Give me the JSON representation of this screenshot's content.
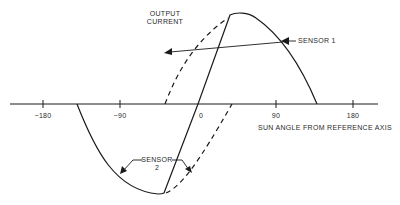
{
  "diagram": {
    "y_axis_label_line1": "OUTPUT",
    "y_axis_label_line2": "CURRENT",
    "x_axis_label": "SUN ANGLE FROM REFERENCE AXIS",
    "x_ticks": [
      "−180",
      "−90",
      "0",
      "90",
      "180"
    ],
    "sensor1_label": "SENSOR 1",
    "sensor2_label_line1": "SENSOR",
    "sensor2_label_line2": "2",
    "colors": {
      "line": "#1a1a1a",
      "text": "#2a2a2a",
      "background": "#ffffff"
    }
  }
}
